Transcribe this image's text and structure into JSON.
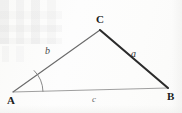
{
  "figure": {
    "kind": "triangle-diagram",
    "background_color": "#fdfdfc",
    "vertices": [
      {
        "id": "A",
        "label": "A",
        "x": 13,
        "y": 92
      },
      {
        "id": "B",
        "label": "B",
        "x": 168,
        "y": 88
      },
      {
        "id": "C",
        "label": "C",
        "x": 100,
        "y": 30
      }
    ],
    "sides": [
      {
        "id": "a",
        "label": "a",
        "from": "C",
        "to": "B",
        "stroke": "#2b2b2b",
        "width": 2.1
      },
      {
        "id": "b",
        "label": "b",
        "from": "A",
        "to": "C",
        "stroke": "#6b6b6b",
        "width": 1.15
      },
      {
        "id": "c",
        "label": "c",
        "from": "A",
        "to": "B",
        "stroke": "#9a9a9a",
        "width": 0.95
      }
    ],
    "angle_marks": [
      {
        "at": "A",
        "radius": 30,
        "stroke": "#7d7d7d",
        "width": 0.9
      }
    ]
  }
}
